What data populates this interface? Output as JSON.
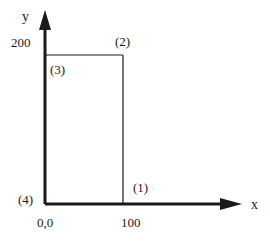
{
  "diagram": {
    "axes": {
      "x_label": "x",
      "y_label": "y",
      "origin_label": "0,0",
      "x_tick_label": "100",
      "y_tick_label": "200"
    },
    "points": [
      {
        "id": 1,
        "label": "(1)",
        "x": 100,
        "y": 0
      },
      {
        "id": 2,
        "label": "(2)",
        "x": 100,
        "y": 200
      },
      {
        "id": 3,
        "label": "(3)",
        "x": 0,
        "y": 200
      },
      {
        "id": 4,
        "label": "(4)",
        "x": 0,
        "y": 0
      }
    ],
    "colors": {
      "stroke": "#1a1a1a",
      "background": "#ffffff"
    }
  }
}
